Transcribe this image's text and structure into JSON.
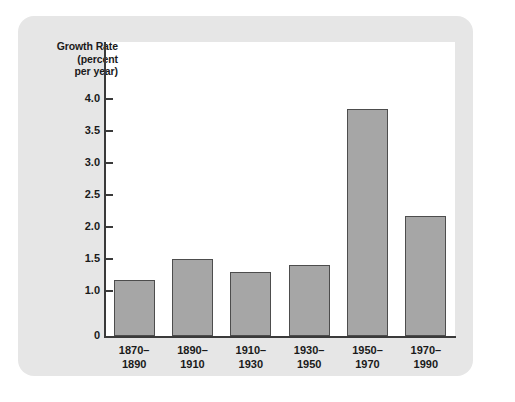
{
  "chart_data": {
    "type": "bar",
    "title": "",
    "xlabel": "",
    "ylabel": "Growth Rate (percent per year)",
    "ylabel_lines": [
      "Growth Rate",
      "(percent",
      "per year)"
    ],
    "categories": [
      "1870–1890",
      "1890–1910",
      "1910–1930",
      "1930–1950",
      "1950–1970",
      "1970–1990"
    ],
    "category_lines": [
      [
        "1870–",
        "1890"
      ],
      [
        "1890–",
        "1910"
      ],
      [
        "1910–",
        "1930"
      ],
      [
        "1930–",
        "1950"
      ],
      [
        "1950–",
        "1970"
      ],
      [
        "1970–",
        "1990"
      ]
    ],
    "values": [
      1.17,
      1.5,
      1.3,
      1.4,
      3.85,
      2.17
    ],
    "ytick_labels": [
      "4.0",
      "3.5",
      "3.0",
      "2.5",
      "2.0",
      "1.5",
      "1.0",
      "0"
    ],
    "ytick_values": [
      4.0,
      3.5,
      3.0,
      2.5,
      2.0,
      1.5,
      1.0,
      0
    ],
    "ylim": [
      0.85,
      4.15
    ],
    "axis_break": true,
    "grid": false,
    "legend": false,
    "bar_fill_color": "#a6a6a6",
    "bar_border_color": "#4d4d4d",
    "panel_color": "#e6e6e6",
    "plot_background": "#ffffff",
    "axis_color": "#3a3a3a"
  }
}
